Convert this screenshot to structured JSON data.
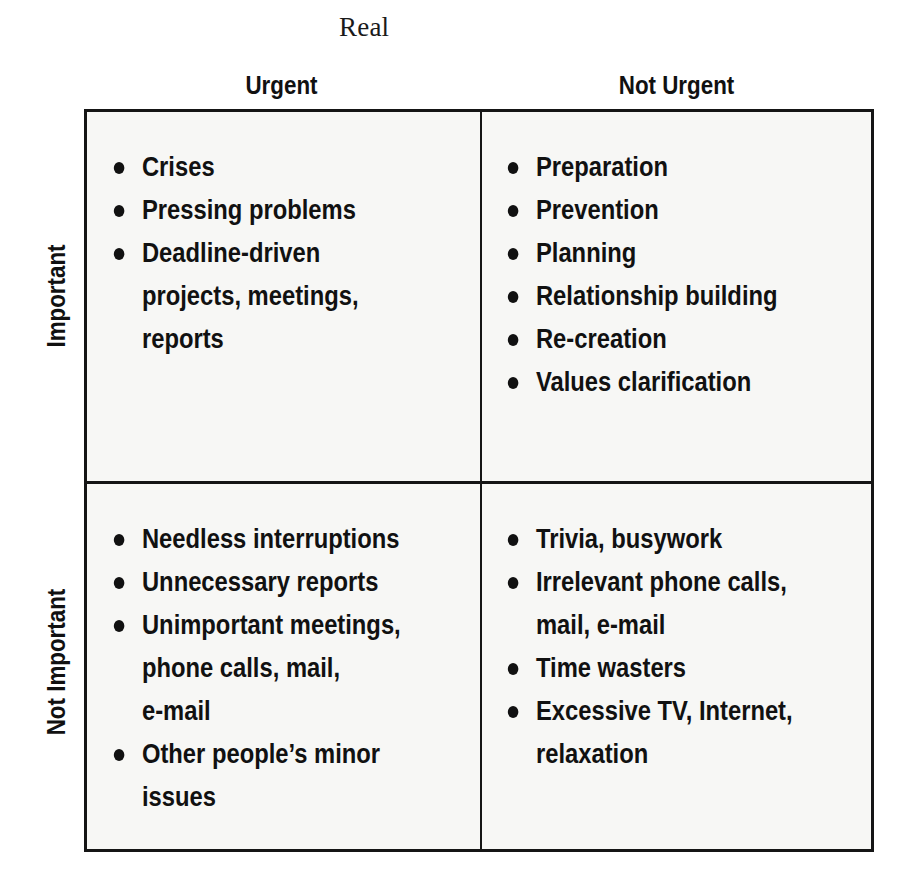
{
  "title": "Real",
  "columns": {
    "urgent": "Urgent",
    "not_urgent": "Not Urgent"
  },
  "rows": {
    "important": "Important",
    "not_important": "Not Important"
  },
  "quadrants": {
    "important_urgent": {
      "items": [
        {
          "lines": [
            "Crises"
          ]
        },
        {
          "lines": [
            "Pressing problems"
          ]
        },
        {
          "lines": [
            "Deadline-driven",
            "projects, meetings,",
            "reports"
          ]
        }
      ]
    },
    "important_not_urgent": {
      "items": [
        {
          "lines": [
            "Preparation"
          ]
        },
        {
          "lines": [
            "Prevention"
          ]
        },
        {
          "lines": [
            "Planning"
          ]
        },
        {
          "lines": [
            "Relationship building"
          ]
        },
        {
          "lines": [
            "Re-creation"
          ]
        },
        {
          "lines": [
            "Values clarification"
          ]
        }
      ]
    },
    "not_important_urgent": {
      "items": [
        {
          "lines": [
            "Needless interruptions"
          ]
        },
        {
          "lines": [
            "Unnecessary reports"
          ]
        },
        {
          "lines": [
            "Unimportant meetings,",
            "phone calls, mail,",
            "e-mail"
          ]
        },
        {
          "lines": [
            "Other people’s minor",
            "issues"
          ]
        }
      ]
    },
    "not_important_not_urgent": {
      "items": [
        {
          "lines": [
            "Trivia, busywork"
          ]
        },
        {
          "lines": [
            "Irrelevant phone calls,",
            "mail, e-mail"
          ]
        },
        {
          "lines": [
            "Time wasters"
          ]
        },
        {
          "lines": [
            "Excessive TV, Internet,",
            "relaxation"
          ]
        }
      ]
    }
  },
  "colors": {
    "ink": "#111111",
    "grid_line": "#151515",
    "cell_background": "#f7f7f5",
    "page_background": "#ffffff"
  }
}
